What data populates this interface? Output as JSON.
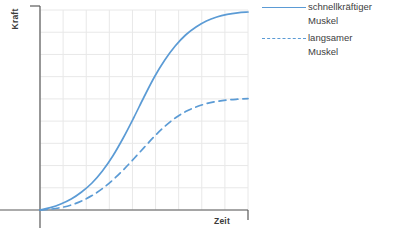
{
  "chart_data": {
    "type": "line",
    "title": "",
    "xlabel": "Zeit",
    "ylabel": "Kraft",
    "xlim": [
      0,
      10
    ],
    "ylim": [
      0,
      1
    ],
    "grid": true,
    "x_tick_labels": [],
    "y_tick_labels": [],
    "legend_position": "right",
    "accent_color": "#5b9bd5",
    "axis_color": "#595959",
    "grid_color": "#e8e8e8",
    "series": [
      {
        "name": "schnellkräftiger Muskel",
        "style": "solid",
        "color": "#5b9bd5",
        "x": [
          0.0,
          0.5,
          1.0,
          1.5,
          2.0,
          2.5,
          3.0,
          3.5,
          4.0,
          4.5,
          5.0,
          5.5,
          6.0,
          6.5,
          7.0,
          7.5,
          8.0,
          8.5,
          9.0,
          9.5,
          10.0
        ],
        "y": [
          0.0,
          0.012,
          0.03,
          0.055,
          0.09,
          0.135,
          0.195,
          0.27,
          0.36,
          0.46,
          0.565,
          0.665,
          0.75,
          0.82,
          0.875,
          0.915,
          0.945,
          0.965,
          0.978,
          0.986,
          0.99
        ]
      },
      {
        "name": "langsamer Muskel",
        "style": "dashed",
        "color": "#5b9bd5",
        "x": [
          0.0,
          0.5,
          1.0,
          1.5,
          2.0,
          2.5,
          3.0,
          3.5,
          4.0,
          4.5,
          5.0,
          5.5,
          6.0,
          6.5,
          7.0,
          7.5,
          8.0,
          8.5,
          9.0,
          9.5,
          10.0
        ],
        "y": [
          0.0,
          0.004,
          0.012,
          0.025,
          0.045,
          0.072,
          0.107,
          0.15,
          0.2,
          0.255,
          0.312,
          0.368,
          0.418,
          0.46,
          0.492,
          0.515,
          0.532,
          0.543,
          0.55,
          0.554,
          0.557
        ]
      }
    ]
  },
  "legend": {
    "entries": [
      {
        "label_line1": "schnellkräftiger",
        "label_line2": "Muskel",
        "style": "solid"
      },
      {
        "label_line1": "langsamer",
        "label_line2": "Muskel",
        "style": "dashed"
      }
    ]
  },
  "axes": {
    "y_label": "Kraft",
    "x_label": "Zeit"
  }
}
